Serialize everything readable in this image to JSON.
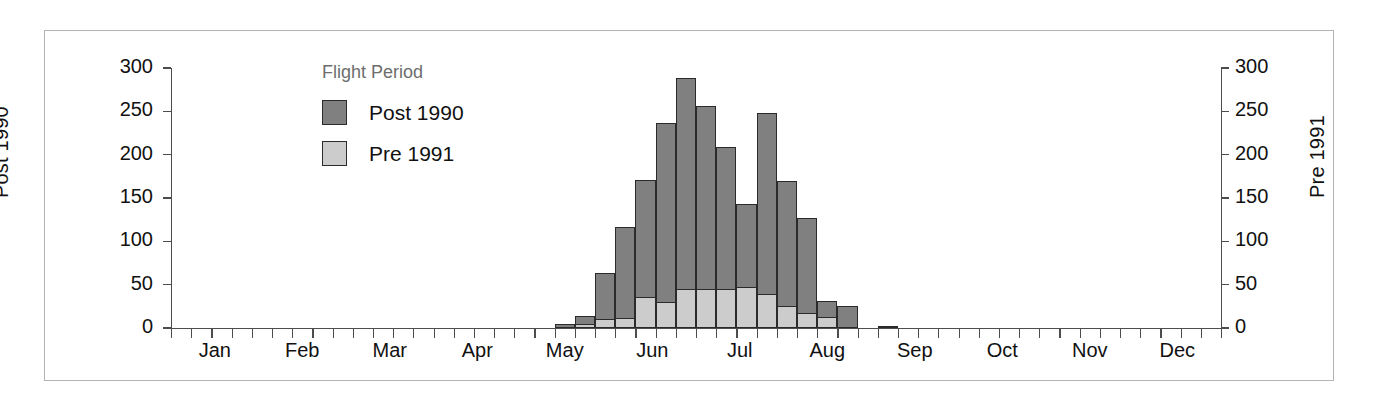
{
  "chart_data": {
    "type": "bar",
    "title": "",
    "subtitle": "",
    "xlabel": "",
    "ylabel": "Post 1990",
    "y2label": "Pre 1991",
    "ylim": [
      0,
      300
    ],
    "y2lim": [
      0,
      300
    ],
    "grid": false,
    "stacked": true,
    "legend_position": "inside-top-left",
    "legend_title": "Flight Period",
    "yticks": [
      0,
      50,
      100,
      150,
      200,
      250,
      300
    ],
    "y2ticks": [
      0,
      50,
      100,
      150,
      200,
      250,
      300
    ],
    "ytick_labels": [
      "0",
      "50",
      "100",
      "150",
      "200",
      "250",
      "300"
    ],
    "y2tick_labels": [
      "0",
      "50",
      "100",
      "150",
      "200",
      "250",
      "300"
    ],
    "month_labels": [
      "Jan",
      "Feb",
      "Mar",
      "Apr",
      "May",
      "Jun",
      "Jul",
      "Aug",
      "Sep",
      "Oct",
      "Nov",
      "Dec"
    ],
    "x_bin_unit": "week",
    "x_bins_total": 52,
    "series": [
      {
        "name": "Post 1990",
        "color": "#808080",
        "values": [
          0,
          0,
          0,
          0,
          0,
          0,
          0,
          0,
          0,
          0,
          0,
          0,
          0,
          0,
          0,
          0,
          0,
          0,
          5,
          14,
          63,
          116,
          171,
          236,
          289,
          256,
          209,
          143,
          248,
          170,
          127,
          31,
          25,
          0,
          2,
          0,
          0,
          0,
          0,
          0,
          0,
          0,
          0,
          0,
          0,
          0,
          0,
          0,
          0,
          0,
          0,
          0
        ]
      },
      {
        "name": "Pre 1991",
        "color": "#cccccc",
        "values": [
          0,
          0,
          0,
          0,
          0,
          0,
          0,
          0,
          0,
          0,
          0,
          0,
          0,
          0,
          0,
          0,
          0,
          0,
          0,
          5,
          10,
          11,
          36,
          30,
          45,
          45,
          45,
          47,
          39,
          25,
          17,
          13,
          0,
          0,
          0,
          0,
          0,
          0,
          0,
          0,
          0,
          0,
          0,
          0,
          0,
          0,
          0,
          0,
          0,
          0,
          0,
          0
        ]
      }
    ],
    "bars": [
      {
        "week": 19,
        "month": "May",
        "post_1990": 5,
        "pre_1991": 0
      },
      {
        "week": 20,
        "month": "May",
        "post_1990": 14,
        "pre_1991": 5
      },
      {
        "week": 21,
        "month": "May",
        "post_1990": 63,
        "pre_1991": 10
      },
      {
        "week": 22,
        "month": "May",
        "post_1990": 116,
        "pre_1991": 11
      },
      {
        "week": 23,
        "month": "Jun",
        "post_1990": 171,
        "pre_1991": 36
      },
      {
        "week": 24,
        "month": "Jun",
        "post_1990": 236,
        "pre_1991": 30
      },
      {
        "week": 25,
        "month": "Jun",
        "post_1990": 289,
        "pre_1991": 45
      },
      {
        "week": 26,
        "month": "Jun",
        "post_1990": 256,
        "pre_1991": 45
      },
      {
        "week": 27,
        "month": "Jul",
        "post_1990": 209,
        "pre_1991": 45
      },
      {
        "week": 28,
        "month": "Jul",
        "post_1990": 143,
        "pre_1991": 47
      },
      {
        "week": 29,
        "month": "Jul",
        "post_1990": 248,
        "pre_1991": 39
      },
      {
        "week": 30,
        "month": "Jul",
        "post_1990": 170,
        "pre_1991": 25
      },
      {
        "week": 31,
        "month": "Aug",
        "post_1990": 127,
        "pre_1991": 17
      },
      {
        "week": 32,
        "month": "Aug",
        "post_1990": 31,
        "pre_1991": 13
      },
      {
        "week": 33,
        "month": "Aug",
        "post_1990": 25,
        "pre_1991": 0
      },
      {
        "week": 35,
        "month": "Sep",
        "post_1990": 2,
        "pre_1991": 0
      }
    ]
  },
  "legend": {
    "title": "Flight Period",
    "items": [
      {
        "label": "Post 1990",
        "color": "#808080"
      },
      {
        "label": "Pre 1991",
        "color": "#cccccc"
      }
    ]
  },
  "axes": {
    "left_title": "Post 1990",
    "right_title": "Pre 1991"
  }
}
